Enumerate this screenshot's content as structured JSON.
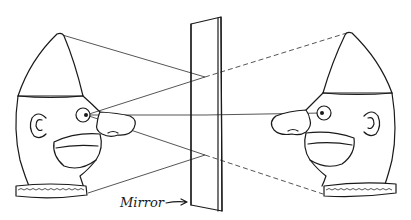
{
  "diagram": {
    "labels": {
      "mirror": "Mirror"
    },
    "objects": [
      {
        "name": "observer-head",
        "description": "Face with pointed cap looking into mirror"
      },
      {
        "name": "mirror-image-head",
        "description": "Virtual image of the face behind the mirror"
      }
    ],
    "rays": {
      "solid": [
        "cap-tip to mirror",
        "eye to mirror (upper)",
        "eye to mirror (center)",
        "eye to mirror (lower)",
        "collar to mirror",
        "eye to image eye"
      ],
      "dashed": [
        "mirror to image cap-tip",
        "mirror to image collar"
      ]
    },
    "colors": {
      "ink": "#1a1a1a",
      "paper": "#ffffff"
    }
  }
}
